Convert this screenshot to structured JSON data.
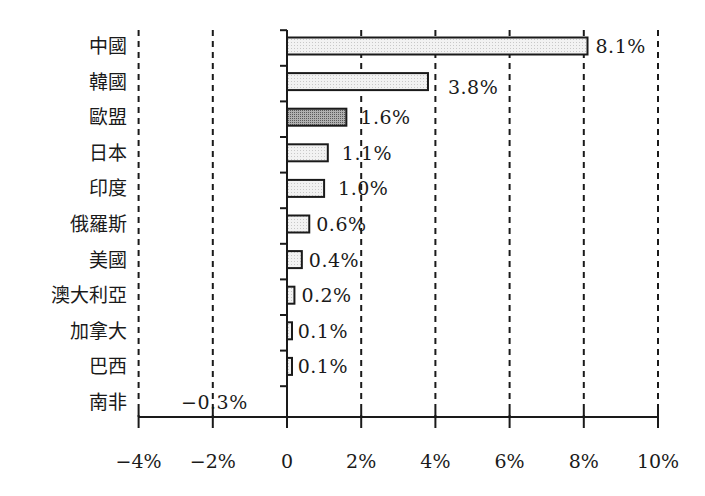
{
  "chart_data": {
    "type": "bar",
    "orientation": "horizontal",
    "title": "",
    "xlabel": "",
    "ylabel": "",
    "xlim": [
      -4,
      10
    ],
    "x_unit": "%",
    "grid": "vertical dashed at every 2%",
    "categories": [
      "中國",
      "韓國",
      "歐盟",
      "日本",
      "印度",
      "俄羅斯",
      "美國",
      "澳大利亞",
      "加拿大",
      "巴西",
      "南非"
    ],
    "values": [
      8.1,
      3.8,
      1.6,
      1.1,
      1.0,
      0.6,
      0.4,
      0.2,
      0.1,
      0.1,
      -0.3
    ],
    "value_labels": [
      "8.1%",
      "3.8%",
      "1.6%",
      "1.1%",
      "1.0%",
      "0.6%",
      "0.4%",
      "0.2%",
      "0.1%",
      "0.1%",
      "−0.3%"
    ],
    "highlight_category": "歐盟",
    "x_ticks": [
      -4,
      -2,
      0,
      2,
      4,
      6,
      8,
      10
    ],
    "x_tick_labels": [
      "−4%",
      "−2%",
      "0",
      "2%",
      "4%",
      "6%",
      "8%",
      "10%"
    ],
    "colors": {
      "bar_fill": "#ececec",
      "highlight_fill": "#9a9a9a",
      "bar_stroke": "#1a1a1a",
      "grid": "#1a1a1a"
    }
  }
}
